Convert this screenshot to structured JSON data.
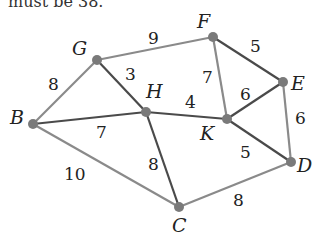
{
  "caption": "must be 38.",
  "graph": {
    "nodes": [
      {
        "id": "G",
        "x": 97,
        "y": 60,
        "label_x": 72,
        "label_y": 55
      },
      {
        "id": "F",
        "x": 213,
        "y": 37,
        "label_x": 197,
        "label_y": 28
      },
      {
        "id": "H",
        "x": 146,
        "y": 112,
        "label_x": 146,
        "label_y": 98
      },
      {
        "id": "E",
        "x": 283,
        "y": 82,
        "label_x": 291,
        "label_y": 90
      },
      {
        "id": "B",
        "x": 33,
        "y": 124,
        "label_x": 10,
        "label_y": 124
      },
      {
        "id": "K",
        "x": 227,
        "y": 119,
        "label_x": 200,
        "label_y": 140
      },
      {
        "id": "D",
        "x": 291,
        "y": 162,
        "label_x": 297,
        "label_y": 172
      },
      {
        "id": "C",
        "x": 179,
        "y": 207,
        "label_x": 172,
        "label_y": 232
      }
    ],
    "edges": [
      {
        "from": "B",
        "to": "G",
        "weight": "8",
        "style": "light",
        "lx": 48,
        "ly": 90
      },
      {
        "from": "G",
        "to": "F",
        "weight": "9",
        "style": "light",
        "lx": 148,
        "ly": 44
      },
      {
        "from": "G",
        "to": "H",
        "weight": "3",
        "style": "dark",
        "lx": 125,
        "ly": 80
      },
      {
        "from": "B",
        "to": "H",
        "weight": "7",
        "style": "dark",
        "lx": 96,
        "ly": 138
      },
      {
        "from": "H",
        "to": "K",
        "weight": "4",
        "style": "dark",
        "lx": 185,
        "ly": 108
      },
      {
        "from": "F",
        "to": "K",
        "weight": "7",
        "style": "light",
        "lx": 202,
        "ly": 83
      },
      {
        "from": "F",
        "to": "E",
        "weight": "5",
        "style": "dark",
        "lx": 250,
        "ly": 52
      },
      {
        "from": "K",
        "to": "E",
        "weight": "6",
        "style": "dark",
        "lx": 240,
        "ly": 100
      },
      {
        "from": "E",
        "to": "D",
        "weight": "6",
        "style": "light",
        "lx": 295,
        "ly": 124
      },
      {
        "from": "K",
        "to": "D",
        "weight": "5",
        "style": "dark",
        "lx": 240,
        "ly": 158
      },
      {
        "from": "H",
        "to": "C",
        "weight": "8",
        "style": "dark",
        "lx": 148,
        "ly": 170
      },
      {
        "from": "B",
        "to": "C",
        "weight": "10",
        "style": "light",
        "lx": 64,
        "ly": 180
      },
      {
        "from": "C",
        "to": "D",
        "weight": "8",
        "style": "light",
        "lx": 233,
        "ly": 206
      }
    ],
    "colors": {
      "light_edge": "#8a8a8a",
      "dark_edge": "#4a4a4a",
      "node": "#7a7a7a",
      "text": "#222222"
    }
  }
}
